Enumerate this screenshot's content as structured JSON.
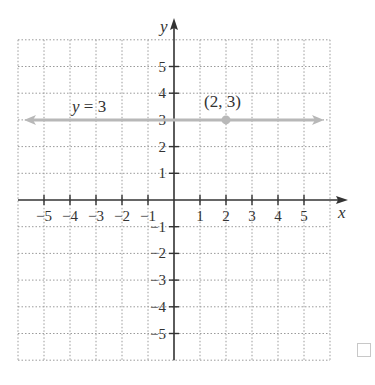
{
  "chart_data": {
    "type": "line",
    "title": "",
    "xlabel": "x",
    "ylabel": "y",
    "xlim": [
      -6,
      6
    ],
    "ylim": [
      -6,
      6
    ],
    "grid": true,
    "x_ticks": [
      -5,
      -4,
      -3,
      -2,
      -1,
      1,
      2,
      3,
      4,
      5
    ],
    "x_tick_labels": [
      "−5",
      "−4",
      "−3",
      "−2",
      "−1",
      "1",
      "2",
      "3",
      "4",
      "5"
    ],
    "y_ticks": [
      5,
      4,
      3,
      2,
      1,
      -1,
      -2,
      -3,
      -4,
      -5
    ],
    "y_tick_labels": [
      "5",
      "4",
      "3",
      "2",
      "1",
      "−1",
      "−2",
      "−3",
      "−4",
      "−5"
    ],
    "series": [
      {
        "name": "y = 3",
        "x": [
          -6,
          6
        ],
        "y": [
          3,
          3
        ],
        "style": "horizontal line with arrows both ends",
        "color": "#b8b8b8"
      }
    ],
    "points": [
      {
        "label": "(2, 3)",
        "x": 2,
        "y": 3,
        "color": "#b8b8b8"
      }
    ],
    "annotations": [
      {
        "text": "y = 3",
        "x": -4,
        "y": 3.5
      },
      {
        "text": "(2, 3)",
        "x": 2,
        "y": 3.6
      }
    ]
  },
  "labels": {
    "x_axis": "x",
    "y_axis": "y",
    "line_eq_var": "y",
    "line_eq_rest": " = 3",
    "point": "(2, 3)"
  },
  "colors": {
    "axis": "#333333",
    "grid": "#9a9a9a",
    "line": "#b8b8b8"
  }
}
